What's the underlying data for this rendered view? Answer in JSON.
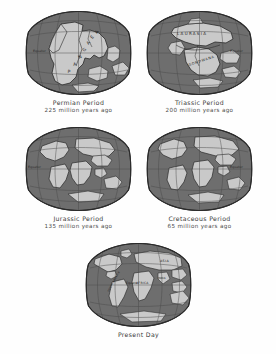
{
  "figure": {
    "colors": {
      "ocean": "#6f6f6f",
      "land": "#c9c9c9",
      "graticule": "#4a4a4a",
      "outline": "#2b2b2b",
      "background": "#fefefe",
      "caption_text": "#3a3a3a"
    },
    "layout": "2-2-1 grid of globe projections"
  },
  "globes": [
    {
      "id": "permian",
      "period": "Permian Period",
      "age": "225 million years ago",
      "equator_label": "Equator",
      "landmass_labels": [
        "PANGAEA"
      ]
    },
    {
      "id": "triassic",
      "period": "Triassic Period",
      "age": "200 million years ago",
      "equator_label": "Equator",
      "landmass_labels": [
        "LAURASIA",
        "GONDWANA"
      ]
    },
    {
      "id": "jurassic",
      "period": "Jurassic Period",
      "age": "135 million years ago",
      "equator_label": "Equator",
      "landmass_labels": []
    },
    {
      "id": "cretaceous",
      "period": "Cretaceous Period",
      "age": "65 million years ago",
      "equator_label": "Equator",
      "landmass_labels": []
    },
    {
      "id": "present",
      "period": "Present Day",
      "age": "",
      "equator_label": "Equator",
      "landmass_labels": [
        "ASIA",
        "AFRICA",
        "INDIA",
        "SOUTH AMERICA"
      ]
    }
  ]
}
